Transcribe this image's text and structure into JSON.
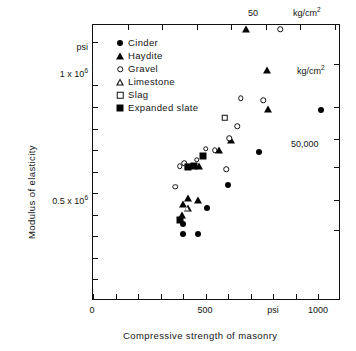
{
  "chart_data": {
    "type": "scatter",
    "title": "",
    "xlabel": "Compressive strength of masonry",
    "ylabel": "Modulus of elasticity",
    "x_unit_primary": "psi",
    "x_unit_secondary": "kg/cm2",
    "y_unit_primary": "psi",
    "y_unit_secondary": "kg/cm2",
    "xlim": [
      0,
      1100
    ],
    "ylim": [
      0,
      1280000
    ],
    "grid": false,
    "legend_position": "upper-left-inside",
    "x_ticks": [
      {
        "value": 0,
        "label": "0"
      },
      {
        "value": 100,
        "label": ""
      },
      {
        "value": 200,
        "label": ""
      },
      {
        "value": 300,
        "label": ""
      },
      {
        "value": 400,
        "label": ""
      },
      {
        "value": 500,
        "label": "500"
      },
      {
        "value": 600,
        "label": ""
      },
      {
        "value": 700,
        "label": ""
      },
      {
        "value": 800,
        "label": ""
      },
      {
        "value": 900,
        "label": "psi"
      },
      {
        "value": 1000,
        "label": "1000"
      }
    ],
    "x_top_ticks": [
      {
        "value": 10,
        "label": ""
      },
      {
        "value": 20,
        "label": ""
      },
      {
        "value": 30,
        "label": ""
      },
      {
        "value": 40,
        "label": ""
      },
      {
        "value": 50,
        "label": "50"
      },
      {
        "value": 60,
        "label": ""
      },
      {
        "value": 70,
        "label": "kg/cm2"
      }
    ],
    "y_ticks": [
      {
        "value": 1200000,
        "label": "psi"
      },
      {
        "value": 1000000,
        "label": "1 x 106"
      },
      {
        "value": 900000,
        "label": ""
      },
      {
        "value": 800000,
        "label": ""
      },
      {
        "value": 700000,
        "label": ""
      },
      {
        "value": 600000,
        "label": ""
      },
      {
        "value": 500000,
        "label": "0.5 x 106"
      },
      {
        "value": 400000,
        "label": ""
      },
      {
        "value": 300000,
        "label": ""
      },
      {
        "value": 200000,
        "label": ""
      },
      {
        "value": 100000,
        "label": ""
      }
    ],
    "y_right_ticks": [
      {
        "value": 1100000,
        "label": "kg/cm2"
      },
      {
        "value": 900000,
        "label": ""
      },
      {
        "value": 750000,
        "label": ""
      },
      {
        "value": 620000,
        "label": "50,000"
      },
      {
        "value": 470000,
        "label": ""
      },
      {
        "value": 330000,
        "label": ""
      }
    ],
    "series": [
      {
        "name": "Cinder",
        "marker": "filled-circle",
        "points": [
          {
            "x": 1010,
            "y": 885000
          },
          {
            "x": 735,
            "y": 690000
          },
          {
            "x": 600,
            "y": 540000
          },
          {
            "x": 505,
            "y": 430000
          },
          {
            "x": 400,
            "y": 355000
          },
          {
            "x": 400,
            "y": 310000
          },
          {
            "x": 465,
            "y": 310000
          }
        ]
      },
      {
        "name": "Haydite",
        "marker": "filled-triangle",
        "points": [
          {
            "x": 680,
            "y": 1260000
          },
          {
            "x": 770,
            "y": 1070000
          },
          {
            "x": 775,
            "y": 890000
          },
          {
            "x": 610,
            "y": 748000
          },
          {
            "x": 560,
            "y": 700000
          },
          {
            "x": 470,
            "y": 628000
          },
          {
            "x": 420,
            "y": 480000
          },
          {
            "x": 465,
            "y": 470000
          },
          {
            "x": 400,
            "y": 450000
          },
          {
            "x": 395,
            "y": 400000
          }
        ]
      },
      {
        "name": "Gravel",
        "marker": "open-circle",
        "points": [
          {
            "x": 830,
            "y": 1260000
          },
          {
            "x": 755,
            "y": 930000
          },
          {
            "x": 655,
            "y": 940000
          },
          {
            "x": 640,
            "y": 810000
          },
          {
            "x": 605,
            "y": 755000
          },
          {
            "x": 540,
            "y": 700000
          },
          {
            "x": 500,
            "y": 705000
          },
          {
            "x": 460,
            "y": 655000
          },
          {
            "x": 590,
            "y": 612000
          },
          {
            "x": 405,
            "y": 640000
          },
          {
            "x": 385,
            "y": 625000
          },
          {
            "x": 365,
            "y": 530000
          }
        ]
      },
      {
        "name": "Limestone",
        "marker": "open-triangle",
        "points": [
          {
            "x": 420,
            "y": 432000
          }
        ]
      },
      {
        "name": "Slag",
        "marker": "open-square",
        "points": [
          {
            "x": 585,
            "y": 850000
          },
          {
            "x": 420,
            "y": 622000
          }
        ]
      },
      {
        "name": "Expanded slate",
        "marker": "filled-square",
        "points": [
          {
            "x": 490,
            "y": 672000
          },
          {
            "x": 450,
            "y": 628000
          },
          {
            "x": 420,
            "y": 620000
          },
          {
            "x": 385,
            "y": 375000
          }
        ]
      }
    ]
  },
  "legend": {
    "items": [
      {
        "label": "Cinder",
        "marker": "filled-circle"
      },
      {
        "label": "Haydite",
        "marker": "filled-triangle"
      },
      {
        "label": "Gravel",
        "marker": "open-circle"
      },
      {
        "label": "Limestone",
        "marker": "open-triangle"
      },
      {
        "label": "Slag",
        "marker": "open-square"
      },
      {
        "label": "Expanded slate",
        "marker": "filled-square"
      }
    ]
  },
  "annotations": {
    "y_axis_title": "Modulus of elasticity",
    "x_axis_title": "Compressive strength of masonry",
    "y_unit_top": "psi",
    "y_right_unit": "kg/cm",
    "y_right_exp": "2",
    "y_right_value": "50,000",
    "x_top_value": "50",
    "x_top_unit": "kg/cm",
    "x_top_exp": "2",
    "y_tick_1e6_prefix": "1 x 10",
    "y_tick_1e6_exp": "6",
    "y_tick_5e5_prefix": "0.5 x 10",
    "y_tick_5e5_exp": "6",
    "x_tick_0": "0",
    "x_tick_500": "500",
    "x_tick_psi": "psi",
    "x_tick_1000": "1000"
  },
  "colors": {
    "ink": "#111111",
    "background": "#ffffff"
  }
}
